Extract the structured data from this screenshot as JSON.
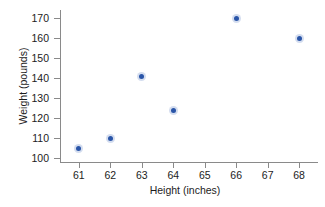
{
  "chart_data": {
    "type": "scatter",
    "title": "",
    "xlabel": "Height (inches)",
    "ylabel": "Weight (pounds)",
    "xlim": [
      60.4,
      68.6
    ],
    "ylim": [
      98,
      174
    ],
    "xticks": [
      61,
      62,
      63,
      64,
      65,
      66,
      67,
      68
    ],
    "xtick_labels": [
      "61",
      "62",
      "63",
      "64",
      "65",
      "66",
      "67",
      "68"
    ],
    "yticks": [
      100,
      110,
      120,
      130,
      140,
      150,
      160,
      170
    ],
    "ytick_labels": [
      "100",
      "110",
      "120",
      "130",
      "140",
      "150",
      "160",
      "170"
    ],
    "grid": false,
    "legend": false,
    "marker_color": "#2a55a8",
    "axis_color": "#8a8a8a",
    "points": [
      {
        "x": 61,
        "y": 105
      },
      {
        "x": 62,
        "y": 110
      },
      {
        "x": 63,
        "y": 141
      },
      {
        "x": 64,
        "y": 124
      },
      {
        "x": 66,
        "y": 170
      },
      {
        "x": 68,
        "y": 160
      }
    ]
  }
}
